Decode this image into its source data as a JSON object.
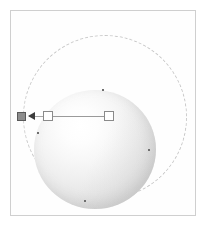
{
  "app": {
    "view_name": "3D Viewport",
    "background_color": "#ffffff"
  },
  "viewport": {
    "name": "modeling-viewport",
    "frame_color": "#cfcfcf",
    "canvas_color": "#fefefe",
    "bounds": {
      "x": 10,
      "y": 10,
      "width": 186,
      "height": 206
    }
  },
  "scene": {
    "object": {
      "type": "sphere",
      "name": "sphere-object",
      "label": "Sphere",
      "selected": true,
      "fill_light": "#ffffff",
      "fill_shadow": "#cfcfcf",
      "center_x": 84,
      "center_y": 138,
      "radius_x": 61,
      "radius_y": 59
    },
    "vertex_dots": [
      {
        "name": "vertex-dot-top",
        "x": 101,
        "y": 88,
        "color": "#6e6e6e"
      },
      {
        "name": "vertex-dot-left",
        "x": 36,
        "y": 131,
        "color": "#6e6e6e"
      },
      {
        "name": "vertex-dot-right",
        "x": 147,
        "y": 148,
        "color": "#6e6e6e"
      },
      {
        "name": "vertex-dot-bottom",
        "x": 83,
        "y": 199,
        "color": "#6e6e6e"
      }
    ],
    "rotate_gizmo": {
      "name": "rotate-gizmo-circle",
      "style": "dashed",
      "color": "#c9c9c9",
      "center_x": 104,
      "center_y": 116,
      "radius": 82
    },
    "axis_manipulator": {
      "name": "axis-manipulator",
      "direction": "negative-x",
      "line_color": "#9a9a9a",
      "handles": [
        {
          "name": "handle-origin-filled",
          "style": "filled",
          "fill": "#8e8e8e",
          "stroke": "#5a5a5a",
          "x": 16,
          "y": 111,
          "size": 9
        },
        {
          "name": "handle-mid-open",
          "style": "open",
          "fill": "#ffffff",
          "stroke": "#8a8a8a",
          "x": 42,
          "y": 110,
          "size": 10
        },
        {
          "name": "handle-end-open",
          "style": "open",
          "fill": "#ffffff",
          "stroke": "#8a8a8a",
          "x": 103,
          "y": 110,
          "size": 10
        }
      ],
      "arrow": {
        "name": "handle-arrow-left",
        "points": "left",
        "color": "#3c3c3c",
        "x": 27,
        "y": 111
      }
    }
  }
}
